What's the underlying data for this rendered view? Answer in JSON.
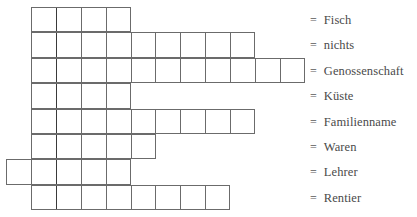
{
  "puzzle": {
    "type": "word-grid-puzzle",
    "grid": {
      "origin_x": 31,
      "origin_y": 7,
      "cell_width": 24.9,
      "cell_height": 25.4,
      "heavy_divider_after_column": 1,
      "rows": 8
    },
    "rows": [
      {
        "index": 1,
        "answer": "Fisch",
        "start_col": 0,
        "cells": 4,
        "equals": "="
      },
      {
        "index": 2,
        "answer": "nichts",
        "start_col": 0,
        "cells": 9,
        "equals": "="
      },
      {
        "index": 3,
        "answer": "Genossenschaft",
        "start_col": 0,
        "cells": 11,
        "equals": "="
      },
      {
        "index": 4,
        "answer": "Küste",
        "start_col": 0,
        "cells": 4,
        "equals": "="
      },
      {
        "index": 5,
        "answer": "Familienname",
        "start_col": 0,
        "cells": 9,
        "equals": "="
      },
      {
        "index": 6,
        "answer": "Waren",
        "start_col": 0,
        "cells": 5,
        "equals": "="
      },
      {
        "index": 7,
        "answer": "Lehrer",
        "start_col": -1,
        "cells": 5,
        "equals": "="
      },
      {
        "index": 8,
        "answer": "Rentier",
        "start_col": 0,
        "cells": 8,
        "equals": "="
      }
    ]
  }
}
